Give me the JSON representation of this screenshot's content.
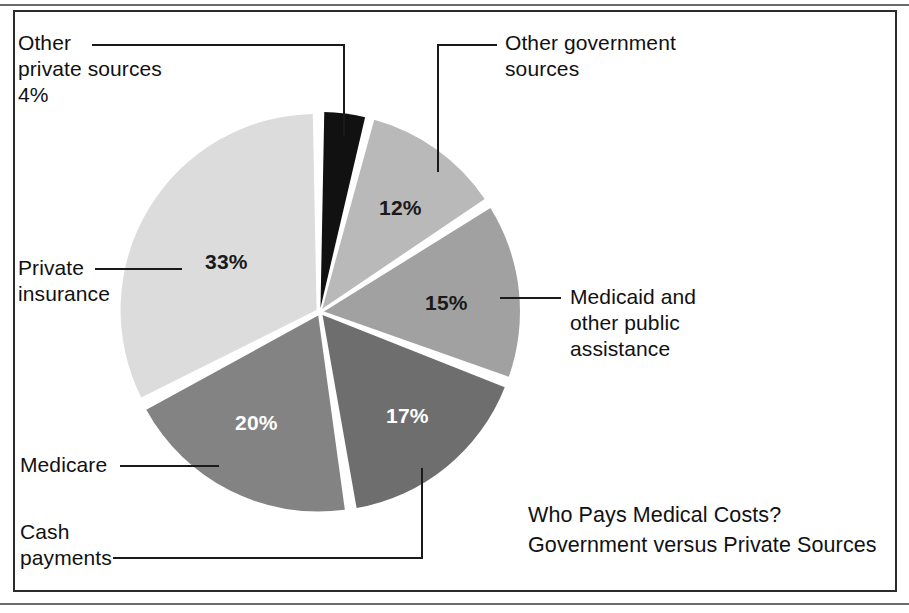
{
  "figure": {
    "title_line1": "Who Pays Medical Costs?",
    "title_line2": "Government versus Private Sources",
    "frame_color": "#2b2b2b",
    "background": "#ffffff"
  },
  "labels": {
    "other_private_l1": "Other",
    "other_private_l2": "private sources",
    "other_private_l3": "4%",
    "other_government_l1": "Other government",
    "other_government_l2": "sources",
    "private_insurance_l1": "Private",
    "private_insurance_l2": "insurance",
    "medicaid_l1": "Medicaid and",
    "medicaid_l2": "other public",
    "medicaid_l3": "assistance",
    "medicare_l1": "Medicare",
    "cash_l1": "Cash",
    "cash_l2": "payments"
  },
  "slice_labels": {
    "private_insurance": "33%",
    "other_government": "12%",
    "medicaid": "15%",
    "cash_payments": "17%",
    "medicare": "20%"
  },
  "chart_data": {
    "type": "pie",
    "xlabel": "",
    "ylabel": "",
    "grid": false,
    "legend_position": "callout-labels",
    "units": "percent of medical costs paid",
    "center": [
      320,
      312
    ],
    "radius": 196,
    "start_angle_deg": -90,
    "direction": "clockwise",
    "exploded": true,
    "gap_deg": 2.2,
    "categories": [
      "Other private sources",
      "Other government sources",
      "Medicaid and other public assistance",
      "Cash payments",
      "Medicare",
      "Private insurance"
    ],
    "values": [
      4,
      12,
      15,
      17,
      20,
      33
    ],
    "data_labels": [
      "4%",
      "12%",
      "15%",
      "17%",
      "20%",
      "33%"
    ],
    "colors": [
      "#111111",
      "#b9b9b9",
      "#a1a1a1",
      "#6e6e6e",
      "#838383",
      "#dcdcdc"
    ],
    "label_text_colors": [
      "#1a1a1a",
      "#1a1a1a",
      "#1a1a1a",
      "#ffffff",
      "#ffffff",
      "#1a1a1a"
    ],
    "slices": [
      {
        "name": "Other private sources",
        "value": 4,
        "label": "4%",
        "color": "#111111",
        "callout": "Other private sources 4%"
      },
      {
        "name": "Other government sources",
        "value": 12,
        "label": "12%",
        "color": "#b9b9b9",
        "callout": "Other government sources"
      },
      {
        "name": "Medicaid and other public assistance",
        "value": 15,
        "label": "15%",
        "color": "#a1a1a1",
        "callout": "Medicaid and other public assistance"
      },
      {
        "name": "Cash payments",
        "value": 17,
        "label": "17%",
        "color": "#6e6e6e",
        "callout": "Cash payments"
      },
      {
        "name": "Medicare",
        "value": 20,
        "label": "20%",
        "color": "#838383",
        "callout": "Medicare"
      },
      {
        "name": "Private insurance",
        "value": 33,
        "label": "33%",
        "color": "#dcdcdc",
        "callout": "Private insurance"
      }
    ],
    "total": 101
  }
}
